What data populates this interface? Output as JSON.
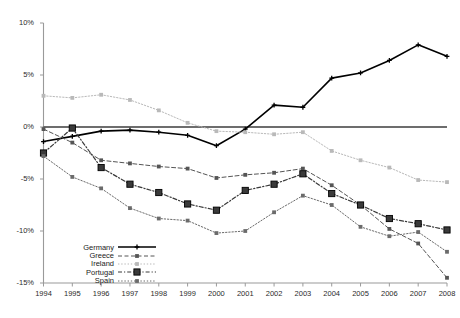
{
  "chart_data": {
    "type": "line",
    "title": "",
    "subtitle": "",
    "xlabel": "",
    "ylabel": "",
    "grid": false,
    "legend_position": "bottom-left",
    "x": [
      "1994",
      "1995",
      "1996",
      "1997",
      "1998",
      "1999",
      "2000",
      "2001",
      "2002",
      "2003",
      "2004",
      "2005",
      "2006",
      "2007",
      "2008"
    ],
    "categories": [
      "1994",
      "1995",
      "1996",
      "1997",
      "1998",
      "1999",
      "2000",
      "2001",
      "2002",
      "2003",
      "2004",
      "2005",
      "2006",
      "2007",
      "2008"
    ],
    "ylim": [
      -15,
      10
    ],
    "yticks": [
      10,
      5,
      0,
      -5,
      -10,
      -15
    ],
    "ytick_labels": [
      "10%",
      "5%",
      "0%",
      "-5%",
      "-10%",
      "-15%"
    ],
    "ytick_suffix": "%",
    "series": [
      {
        "name": "Germany",
        "color": "#000000",
        "marker": "cross",
        "dash": "solid",
        "width": 1.6,
        "values": [
          -1.4,
          -0.9,
          -0.4,
          -0.3,
          -0.5,
          -0.8,
          -1.8,
          -0.2,
          2.1,
          1.9,
          4.7,
          5.2,
          6.4,
          7.9,
          6.8
        ]
      },
      {
        "name": "Greece",
        "color": "#555555",
        "marker": "square",
        "dash": "dashed",
        "width": 1.0,
        "values": [
          -0.2,
          -1.5,
          -3.2,
          -3.5,
          -3.8,
          -4.0,
          -4.9,
          -4.6,
          -4.4,
          -4.0,
          -5.6,
          -7.5,
          -9.8,
          -11.2,
          -14.5
        ]
      },
      {
        "name": "Ireland",
        "color": "#b9b9b9",
        "marker": "square",
        "dash": "dotted",
        "width": 1.0,
        "values": [
          3.0,
          2.8,
          3.1,
          2.6,
          1.6,
          0.4,
          -0.4,
          -0.5,
          -0.7,
          -0.5,
          -2.3,
          -3.2,
          -3.9,
          -5.1,
          -5.3
        ]
      },
      {
        "name": "Portugal",
        "color": "#3a3a3a",
        "marker": "square-large",
        "dash": "dashdot",
        "width": 1.2,
        "values": [
          -2.5,
          -0.1,
          -3.9,
          -5.5,
          -6.3,
          -7.4,
          -8.0,
          -6.1,
          -5.5,
          -4.5,
          -6.4,
          -7.5,
          -8.8,
          -9.3,
          -9.9
        ]
      },
      {
        "name": "Spain",
        "color": "#6b6b6b",
        "marker": "square",
        "dash": "dotted",
        "width": 1.0,
        "values": [
          -2.8,
          -4.8,
          -5.9,
          -7.8,
          -8.8,
          -9.0,
          -10.2,
          -10.0,
          -8.2,
          -6.6,
          -7.5,
          -9.6,
          -10.5,
          -10.1,
          -12.0
        ]
      }
    ]
  },
  "legend": {
    "items": [
      {
        "label": "Germany"
      },
      {
        "label": "Greece"
      },
      {
        "label": "Ireland"
      },
      {
        "label": "Portugal"
      },
      {
        "label": "Spain"
      }
    ]
  },
  "axes": {
    "y_tick_labels": [
      "10%",
      "5%",
      "0%",
      "-5%",
      "-10%",
      "-15%"
    ],
    "x_tick_labels": [
      "1994",
      "1995",
      "1996",
      "1997",
      "1998",
      "1999",
      "2000",
      "2001",
      "2002",
      "2003",
      "2004",
      "2005",
      "2006",
      "2007",
      "2008"
    ]
  },
  "colors": {
    "germany": "#000000",
    "greece": "#555555",
    "ireland": "#b9b9b9",
    "portugal": "#3a3a3a",
    "spain": "#6b6b6b",
    "axis": "#9a9a9a",
    "zero_line": "#3c3c3c",
    "text": "#2b2b2b",
    "background": "#ffffff"
  }
}
